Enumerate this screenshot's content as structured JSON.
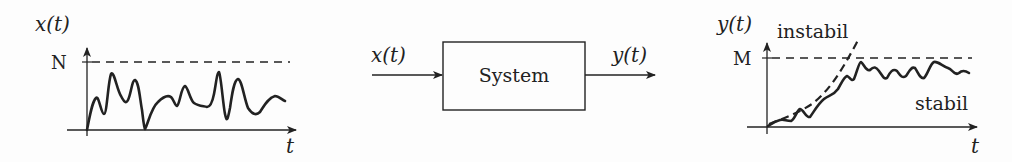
{
  "diagram": {
    "input_plot": {
      "ylabel": "x(t)",
      "xlabel": "t",
      "bound_label": "N",
      "description": "Bounded input signal fluctuating below level N"
    },
    "system_block": {
      "label": "System",
      "input_label": "x(t)",
      "output_label": "y(t)"
    },
    "output_plot": {
      "ylabel": "y(t)",
      "xlabel": "t",
      "bound_label": "M",
      "unstable_label": "instabil",
      "stable_label": "stabil",
      "description": "Stable output stays bounded below M; unstable output grows past M"
    },
    "colors": {
      "stroke": "#222222",
      "background": "#fdfdfd"
    }
  }
}
